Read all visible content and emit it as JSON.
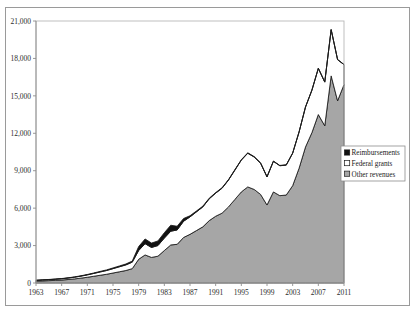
{
  "chart_data": {
    "type": "area",
    "title": "",
    "subtitle": "",
    "xlabel": "",
    "ylabel": "",
    "stacked": true,
    "grid": false,
    "legend_position": "right",
    "xlim": [
      1963,
      2011
    ],
    "ylim": [
      0,
      21000
    ],
    "ytick_labels": [
      "0",
      "3,000",
      "6,000",
      "9,000",
      "12,000",
      "15,000",
      "18,000",
      "21,000"
    ],
    "ytick_values": [
      0,
      3000,
      6000,
      9000,
      12000,
      15000,
      18000,
      21000
    ],
    "xtick_labels": [
      "1963",
      "1967",
      "1971",
      "1975",
      "1979",
      "1983",
      "1987",
      "1991",
      "1995",
      "1999",
      "2003",
      "2007",
      "2011"
    ],
    "xtick_values": [
      1963,
      1967,
      1971,
      1975,
      1979,
      1983,
      1987,
      1991,
      1995,
      1999,
      2003,
      2007,
      2011
    ],
    "x": [
      1963,
      1964,
      1965,
      1966,
      1967,
      1968,
      1969,
      1970,
      1971,
      1972,
      1973,
      1974,
      1975,
      1976,
      1977,
      1978,
      1979,
      1980,
      1981,
      1982,
      1983,
      1984,
      1985,
      1986,
      1987,
      1988,
      1989,
      1990,
      1991,
      1992,
      1993,
      1994,
      1995,
      1996,
      1997,
      1998,
      1999,
      2000,
      2001,
      2002,
      2003,
      2004,
      2005,
      2006,
      2007,
      2008,
      2009,
      2010,
      2011
    ],
    "series": [
      {
        "name": "Other revenues",
        "color": "#a6a6a6",
        "values": [
          150,
          170,
          190,
          210,
          240,
          280,
          330,
          390,
          460,
          540,
          620,
          700,
          800,
          900,
          1000,
          1150,
          1900,
          2250,
          2050,
          2150,
          2600,
          3050,
          3100,
          3650,
          3900,
          4200,
          4500,
          5000,
          5350,
          5600,
          6100,
          6700,
          7300,
          7700,
          7500,
          7100,
          6250,
          7300,
          7000,
          7050,
          7800,
          9200,
          10900,
          12050,
          13500,
          12600,
          16600,
          14600,
          15900
        ]
      },
      {
        "name": "Federal grants",
        "color": "#ffffff",
        "values": [
          60,
          70,
          80,
          90,
          100,
          115,
          135,
          160,
          190,
          225,
          265,
          300,
          350,
          400,
          450,
          520,
          700,
          900,
          800,
          850,
          1000,
          1100,
          1150,
          1300,
          1400,
          1500,
          1600,
          1750,
          1850,
          2000,
          2150,
          2350,
          2550,
          2700,
          2600,
          2500,
          2250,
          2450,
          2400,
          2400,
          2600,
          2900,
          3200,
          3400,
          3700,
          3500,
          3700,
          3300,
          1600
        ]
      },
      {
        "name": "Reimbursements",
        "color": "#111111",
        "values": [
          10,
          12,
          14,
          16,
          18,
          20,
          24,
          28,
          32,
          38,
          44,
          50,
          58,
          66,
          74,
          85,
          320,
          380,
          350,
          370,
          430,
          480,
          300,
          220,
          90,
          70,
          60,
          50,
          45,
          40,
          40,
          38,
          36,
          34,
          32,
          30,
          28,
          26,
          25,
          24,
          23,
          22,
          21,
          20,
          20,
          19,
          18,
          18,
          18
        ]
      }
    ],
    "totals": [
      220,
      252,
      284,
      316,
      358,
      415,
      489,
      578,
      682,
      803,
      929,
      1050,
      1208,
      1366,
      1524,
      1755,
      2920,
      3530,
      3200,
      3370,
      4030,
      4630,
      4550,
      5170,
      5390,
      5770,
      6160,
      6800,
      7245,
      7640,
      8290,
      9088,
      9886,
      10434,
      10132,
      9630,
      8528,
      9776,
      9425,
      9474,
      10423,
      12122,
      14121,
      15470,
      17220,
      16119,
      20318,
      17918,
      17518
    ]
  },
  "legend": {
    "items": [
      {
        "label": "Reimbursements",
        "swatch": "black"
      },
      {
        "label": "Federal grants",
        "swatch": "white"
      },
      {
        "label": "Other revenues",
        "swatch": "gray"
      }
    ]
  }
}
